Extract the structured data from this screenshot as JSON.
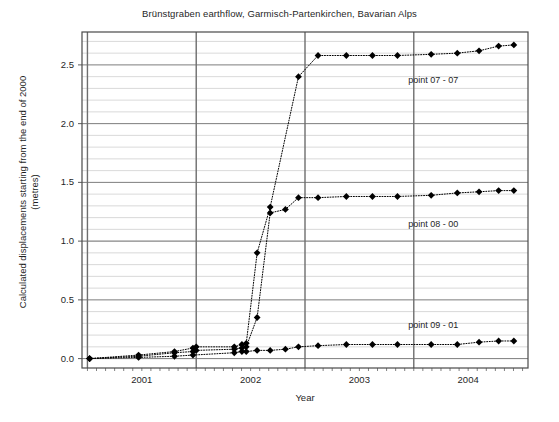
{
  "chart_data": {
    "type": "scatter",
    "title": "Brünstgraben earthflow, Garmisch-Partenkirchen, Bavarian Alps",
    "xlabel": "Year",
    "ylabel_line1": "Calculated displacements starting from the end of 2000",
    "ylabel_line2": "(metres)",
    "xlim": [
      2000.45,
      2004.55
    ],
    "ylim": [
      -0.08,
      2.78
    ],
    "xticks": [
      2001,
      2002,
      2003,
      2004
    ],
    "xtick_labels": [
      "2001",
      "2002",
      "2003",
      "2004"
    ],
    "yticks": [
      0.0,
      0.5,
      1.0,
      1.5,
      2.0,
      2.5
    ],
    "ytick_labels": [
      "0.0",
      "0.5",
      "1.0",
      "1.5",
      "2.0",
      "2.5"
    ],
    "y_minor_step": 0.1,
    "grid": "major x vertical lines at year boundaries, horizontal major and minor y lines",
    "legend": "inline annotations at right of each series",
    "marker": "filled diamond",
    "line_style": "dotted",
    "color": "#000000",
    "series": [
      {
        "name": "point 07 - 07",
        "annotation": "point 07 - 07",
        "annotation_x": 2003.45,
        "annotation_y": 2.36,
        "x": [
          2000.52,
          2000.97,
          2001.3,
          2001.47,
          2001.5,
          2001.85,
          2001.92,
          2001.96,
          2002.06,
          2002.18,
          2002.44,
          2002.62,
          2002.88,
          2003.12,
          2003.35,
          2003.66,
          2003.9,
          2004.1,
          2004.28,
          2004.42
        ],
        "y": [
          0.0,
          0.03,
          0.06,
          0.09,
          0.1,
          0.1,
          0.12,
          0.13,
          0.9,
          1.29,
          2.4,
          2.58,
          2.58,
          2.58,
          2.58,
          2.59,
          2.6,
          2.62,
          2.66,
          2.67
        ]
      },
      {
        "name": "point 08 - 00",
        "annotation": "point 08 - 00",
        "annotation_x": 2003.45,
        "annotation_y": 1.14,
        "x": [
          2000.52,
          2000.97,
          2001.3,
          2001.47,
          2001.5,
          2001.85,
          2001.92,
          2001.96,
          2002.06,
          2002.18,
          2002.32,
          2002.44,
          2002.62,
          2002.88,
          2003.12,
          2003.35,
          2003.66,
          2003.9,
          2004.1,
          2004.28,
          2004.42
        ],
        "y": [
          0.0,
          0.02,
          0.05,
          0.06,
          0.07,
          0.08,
          0.09,
          0.1,
          0.35,
          1.24,
          1.27,
          1.37,
          1.37,
          1.38,
          1.38,
          1.38,
          1.39,
          1.41,
          1.42,
          1.43,
          1.43
        ]
      },
      {
        "name": "point 09 - 01",
        "annotation": "point 09 - 01",
        "annotation_x": 2003.45,
        "annotation_y": 0.28,
        "x": [
          2000.52,
          2000.97,
          2001.3,
          2001.47,
          2001.85,
          2001.92,
          2001.96,
          2002.06,
          2002.18,
          2002.32,
          2002.44,
          2002.62,
          2002.88,
          2003.12,
          2003.35,
          2003.66,
          2003.9,
          2004.1,
          2004.28,
          2004.42
        ],
        "y": [
          0.0,
          0.01,
          0.02,
          0.03,
          0.05,
          0.06,
          0.06,
          0.07,
          0.07,
          0.08,
          0.1,
          0.11,
          0.12,
          0.12,
          0.12,
          0.12,
          0.12,
          0.14,
          0.15,
          0.15
        ]
      }
    ]
  },
  "colors": {
    "axis": "#4a4a4a",
    "gridline_major": "#6e6e6e",
    "gridline_minor": "#c8c8c8",
    "marker": "#000000",
    "text": "#1f1f1f"
  }
}
